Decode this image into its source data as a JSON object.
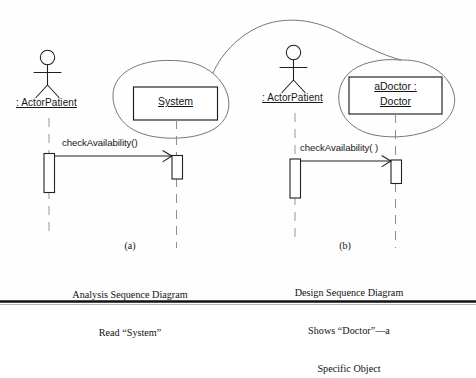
{
  "figure": {
    "kind": "uml-sequence-diagram-comparison",
    "background_color": "#fefefe",
    "ink_color": "#1a1a1a",
    "sketch_color": "#6b6b6b"
  },
  "panel_a": {
    "id": "a",
    "caption_letter": "(a)",
    "caption_lines": [
      "Analysis Sequence Diagram",
      "Read “System”"
    ],
    "actor": {
      "label": "ActorPatient",
      "display_label": ": ActorPatient",
      "underlined": true
    },
    "object_box": {
      "lines": [
        "System"
      ],
      "underlined": true
    },
    "message": {
      "label": "checkAvailability()",
      "direction": "left-to-right",
      "arrow_type": "open-arrowhead"
    },
    "annotation": {
      "shape": "hand-drawn-blob",
      "encircles": "System"
    }
  },
  "panel_b": {
    "id": "b",
    "caption_letter": "(b)",
    "caption_lines": [
      "Design Sequence Diagram",
      "Shows “Doctor”—a",
      "Specific Object"
    ],
    "actor": {
      "label": "ActorPatient",
      "display_label": ": ActorPatient",
      "underlined": true
    },
    "object_box": {
      "lines": [
        "aDoctor :",
        "Doctor"
      ],
      "underlined": true
    },
    "message": {
      "label": "checkAvailability( )",
      "direction": "left-to-right",
      "arrow_type": "open-arrowhead"
    },
    "annotation": {
      "shape": "hand-drawn-blob",
      "encircles": "aDoctor : Doctor"
    }
  },
  "connector": {
    "kind": "hand-drawn-arc",
    "from": "panel_a.annotation",
    "to": "panel_b.annotation"
  },
  "footer_rule": {
    "present": true
  }
}
